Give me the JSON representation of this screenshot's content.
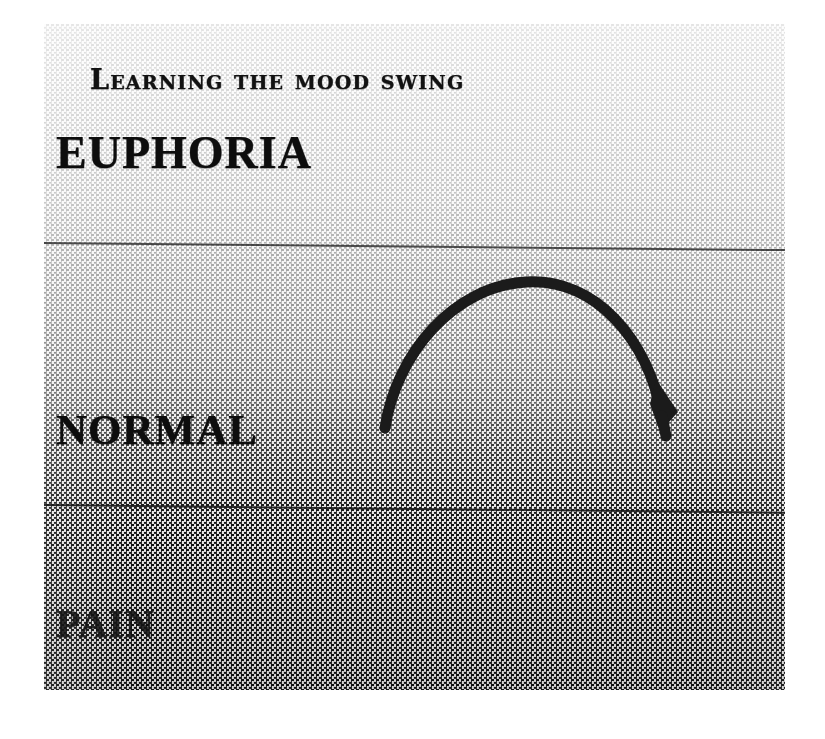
{
  "figure": {
    "title": "Learning the mood swing",
    "zones": [
      {
        "id": "euphoria",
        "label": "EUPHORIA"
      },
      {
        "id": "normal",
        "label": "NORMAL"
      },
      {
        "id": "pain",
        "label": "PAIN"
      }
    ],
    "arrow": {
      "name": "mood-swing-arc-arrow",
      "description": "hand-drawn arc rising from the NORMAL band up toward EUPHORIA and curving back down, ending with an arrowhead in the NORMAL band"
    },
    "colors": {
      "ink": "#1b1b1b",
      "rule": "#2a2a2a",
      "paper": "#ffffff",
      "top_tone": "#f4f4f4",
      "bottom_tone": "#707070"
    }
  }
}
